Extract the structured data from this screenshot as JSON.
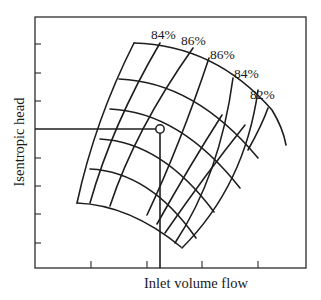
{
  "figure": {
    "type": "compressor-performance-map",
    "x_axis_label": "Inlet volume flow",
    "y_axis_label": "Isentropic head",
    "efficiency_labels": [
      "84%",
      "86%",
      "86%",
      "84%",
      "82%"
    ],
    "x_tick_count": 4,
    "y_tick_count": 8,
    "speed_line_count": 6,
    "flow_line_count": 6,
    "operating_point": {
      "label": "",
      "marker": "open-circle"
    },
    "colors": {
      "line": "#1e1e1e",
      "background": "#ffffff"
    }
  }
}
